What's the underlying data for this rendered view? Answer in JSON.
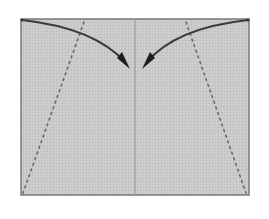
{
  "diagram": {
    "type": "origami-fold-step",
    "colors": {
      "background": "#ffffff",
      "paper": "#c9c9c9",
      "paper_border": "#7a7a7a",
      "crease": "#9a9a9a",
      "arrow": "#3a3a3a",
      "dotted_line": "#6a6a6a"
    },
    "paper": {
      "x": 21,
      "y": 19,
      "width": 228,
      "height": 176
    },
    "center_crease": {
      "x": 135
    },
    "fold_lines": [
      {
        "name": "left-valley-fold",
        "x1": 84,
        "y1": 22,
        "x2": 23,
        "y2": 193,
        "style": "dotted"
      },
      {
        "name": "right-valley-fold",
        "x1": 186,
        "y1": 22,
        "x2": 246,
        "y2": 193,
        "style": "dotted"
      }
    ],
    "arrows": [
      {
        "name": "left-fold-arrow",
        "from": [
          22,
          20
        ],
        "to": [
          129,
          68
        ]
      },
      {
        "name": "right-fold-arrow",
        "from": [
          248,
          20
        ],
        "to": [
          143,
          68
        ]
      }
    ]
  }
}
